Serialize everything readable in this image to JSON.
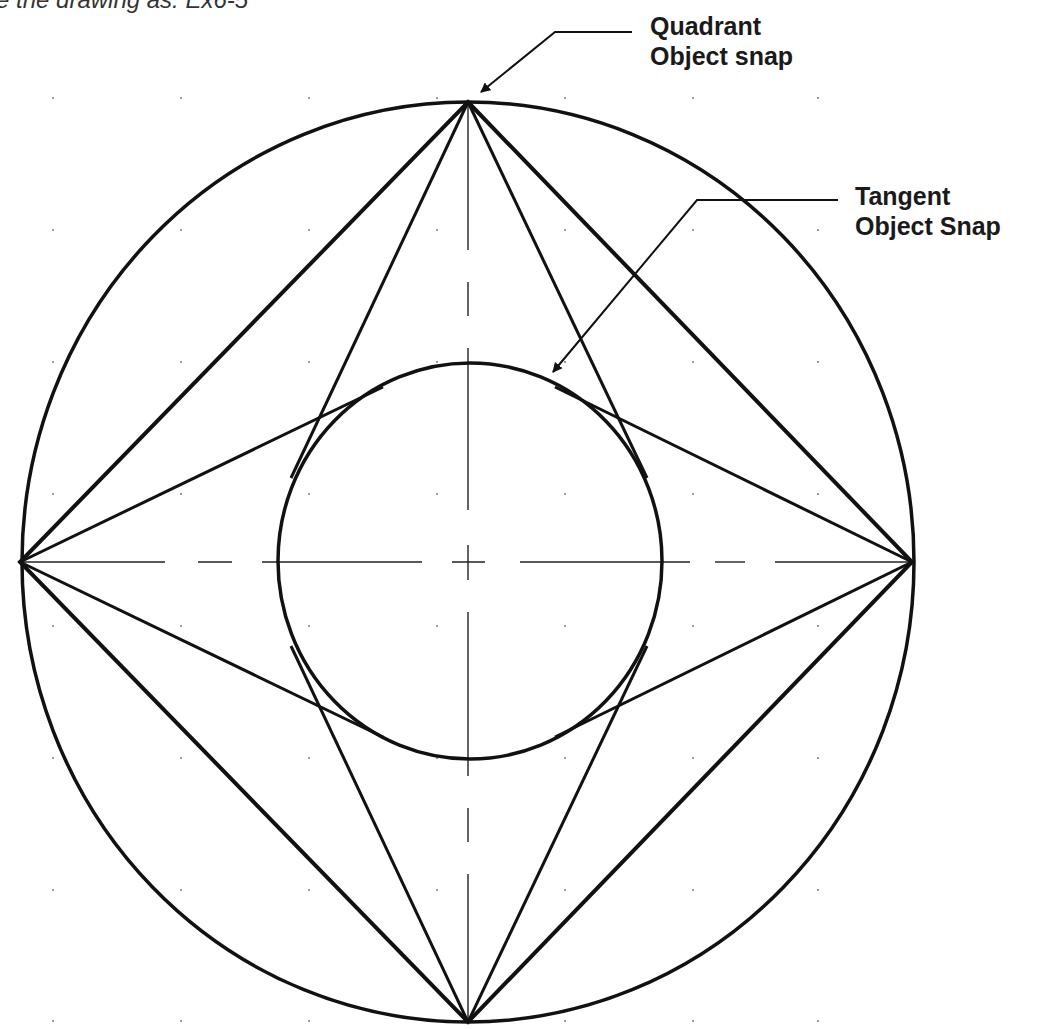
{
  "caption": {
    "text": "e the drawing as: Ex6-5"
  },
  "labels": {
    "quadrant": {
      "line1": "Quadrant",
      "line2": "Object snap"
    },
    "tangent": {
      "line1": "Tangent",
      "line2": "Object Snap"
    }
  },
  "drawing": {
    "stroke_color": "#111111",
    "grid_dot_color": "#777777",
    "center": [
      468,
      562
    ],
    "outer_circle": {
      "rx": 446,
      "ry": 460
    },
    "inner_circle": {
      "rx": 192,
      "ry": 198
    },
    "quadrant_points": {
      "top": [
        468,
        102
      ],
      "bottom": [
        468,
        1022
      ],
      "left": [
        20,
        562
      ],
      "right": [
        912,
        562
      ]
    },
    "grid": {
      "x": [
        53,
        181,
        309,
        437,
        565,
        693,
        818
      ],
      "y": [
        98,
        230,
        362,
        494,
        626,
        758,
        890,
        1021
      ]
    }
  }
}
